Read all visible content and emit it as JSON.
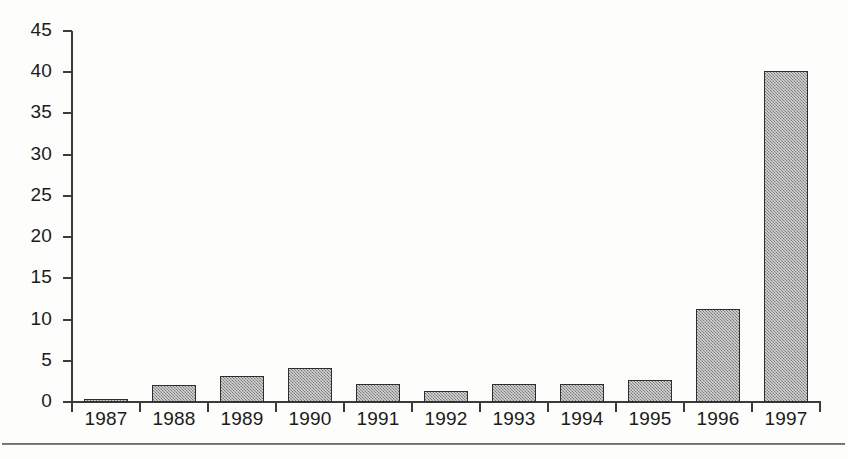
{
  "chart_data": {
    "type": "bar",
    "title": "",
    "subtitle": "",
    "xlabel": "",
    "ylabel": "",
    "categories": [
      "1987",
      "1988",
      "1989",
      "1990",
      "1991",
      "1992",
      "1993",
      "1994",
      "1995",
      "1996",
      "1997"
    ],
    "values": [
      0.4,
      2.1,
      3.2,
      4.1,
      2.2,
      1.3,
      2.2,
      2.2,
      2.7,
      11.3,
      40.2
    ],
    "series": [
      {
        "name": "",
        "values": [
          0.4,
          2.1,
          3.2,
          4.1,
          2.2,
          1.3,
          2.2,
          2.2,
          2.7,
          11.3,
          40.2
        ]
      }
    ],
    "ylim": [
      0,
      45
    ],
    "ytick_labels": [
      "0",
      "5",
      "10",
      "15",
      "20",
      "25",
      "30",
      "35",
      "40",
      "45"
    ],
    "ytick_values": [
      0,
      5,
      10,
      15,
      20,
      25,
      30,
      35,
      40,
      45
    ],
    "xtick_labels": [
      "1987",
      "1988",
      "1989",
      "1990",
      "1991",
      "1992",
      "1993",
      "1994",
      "1995",
      "1996",
      "1997"
    ],
    "grid": false,
    "legend": false,
    "legend_position": "none",
    "annotations": [],
    "bar_fill_color": "#9d9d9d",
    "bar_border_color": "#2e2e2e",
    "axis_color": "#3b3b3b",
    "text_color": "#1b1b1b",
    "background_color": "#fdfdfb"
  },
  "figure": {
    "rule_color": "#4a4a4a"
  }
}
